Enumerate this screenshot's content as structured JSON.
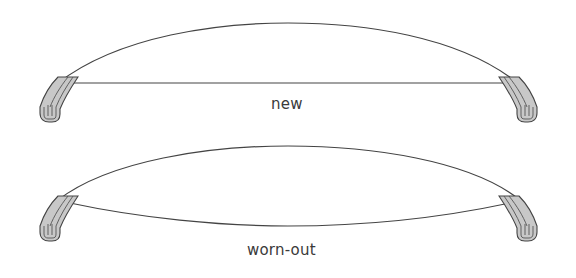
{
  "figure": {
    "type": "wiper blade comparison diagram",
    "panels": [
      {
        "id": "new",
        "label": "new",
        "description": "wiper blade with flat (straight) rubber edge under curved frame"
      },
      {
        "id": "worn-out",
        "label": "worn-out",
        "description": "wiper blade with bowed/curved rubber edge under curved frame"
      }
    ]
  },
  "colors": {
    "line": "#444444",
    "blade_fill": "#c8c8c8",
    "background": "#ffffff",
    "text": "#3a3a3a"
  }
}
